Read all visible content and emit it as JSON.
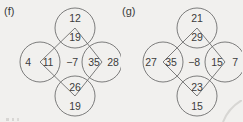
{
  "page": {
    "background_color": "#f1f0ee",
    "stroke_color": "#6e6e6e",
    "text_color": "#3c3c3c"
  },
  "puzzles": [
    {
      "label": "(f)",
      "center": "−7",
      "nodes": {
        "top": {
          "outer": "12",
          "inner": "19"
        },
        "left": {
          "outer": "4",
          "inner": "11"
        },
        "right": {
          "outer": "28",
          "inner": "35"
        },
        "bottom": {
          "outer": "19",
          "inner": "26"
        }
      }
    },
    {
      "label": "(g)",
      "center": "−8",
      "nodes": {
        "top": {
          "outer": "21",
          "inner": "29"
        },
        "left": {
          "outer": "27",
          "inner": "35"
        },
        "right": {
          "outer": "7",
          "inner": "15"
        },
        "bottom": {
          "outer": "15",
          "inner": "23"
        }
      }
    }
  ]
}
